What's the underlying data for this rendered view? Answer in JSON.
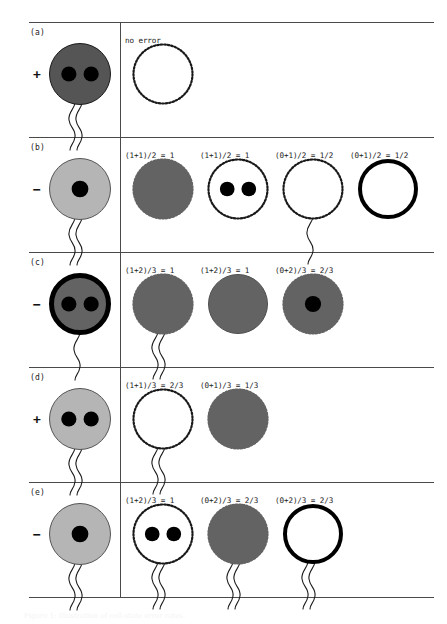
{
  "figure": {
    "label": "error-diagram",
    "caption": "Figure 1: Illustration of cell-state error rates.",
    "no_error_label": "no error",
    "divider_x": 120,
    "colors": {
      "rule": "#4a4a4a",
      "text": "#1a1a1a",
      "dark_gray": "#555555",
      "mid_gray": "#636363",
      "light_gray": "#b5b5b5",
      "black": "#000000",
      "white": "#ffffff"
    }
  },
  "rows": [
    {
      "tag": "(a)",
      "sign": "+",
      "source": {
        "fill": "#555555",
        "stroke": "#1a1a1a",
        "stroke_width": 1,
        "dotted": false,
        "dots": 2,
        "flagella": 2
      },
      "outcomes": [
        {
          "equation": "no error",
          "fill": "#ffffff",
          "stroke": "#1a1a1a",
          "stroke_width": 1,
          "dotted": true,
          "dots": 0,
          "flagella": 0
        }
      ]
    },
    {
      "tag": "(b)",
      "sign": "−",
      "source": {
        "fill": "#b5b5b5",
        "stroke": "#555555",
        "stroke_width": 1,
        "dotted": false,
        "dots": 1,
        "flagella": 2
      },
      "outcomes": [
        {
          "equation": "(1+1)/2 = 1",
          "fill": "#636363",
          "stroke": "#636363",
          "stroke_width": 1,
          "dotted": true,
          "dots": 0,
          "flagella": 0
        },
        {
          "equation": "(1+1)/2 = 1",
          "fill": "#ffffff",
          "stroke": "#1a1a1a",
          "stroke_width": 1,
          "dotted": true,
          "dots": 2,
          "flagella": 0
        },
        {
          "equation": "(0+1)/2 = 1/2",
          "fill": "#ffffff",
          "stroke": "#1a1a1a",
          "stroke_width": 1,
          "dotted": true,
          "dots": 0,
          "flagella": 1
        },
        {
          "equation": "(0+1)/2 = 1/2",
          "fill": "#ffffff",
          "stroke": "#000000",
          "stroke_width": 4,
          "dotted": false,
          "dots": 0,
          "flagella": 0
        }
      ]
    },
    {
      "tag": "(c)",
      "sign": "−",
      "source": {
        "fill": "#636363",
        "stroke": "#000000",
        "stroke_width": 5,
        "dotted": false,
        "dots": 2,
        "flagella": 1
      },
      "outcomes": [
        {
          "equation": "(1+2)/3 = 1",
          "fill": "#636363",
          "stroke": "#636363",
          "stroke_width": 1,
          "dotted": true,
          "dots": 0,
          "flagella": 2
        },
        {
          "equation": "(1+2)/3 = 1",
          "fill": "#636363",
          "stroke": "#4f4f4f",
          "stroke_width": 1,
          "dotted": false,
          "dots": 0,
          "flagella": 0
        },
        {
          "equation": "(0+2)/3 = 2/3",
          "fill": "#636363",
          "stroke": "#636363",
          "stroke_width": 1,
          "dotted": true,
          "dots": 1,
          "flagella": 0
        }
      ]
    },
    {
      "tag": "(d)",
      "sign": "+",
      "source": {
        "fill": "#b5b5b5",
        "stroke": "#555555",
        "stroke_width": 1,
        "dotted": false,
        "dots": 2,
        "flagella": 2
      },
      "outcomes": [
        {
          "equation": "(1+1)/3 = 2/3",
          "fill": "#ffffff",
          "stroke": "#1a1a1a",
          "stroke_width": 1,
          "dotted": true,
          "dots": 0,
          "flagella": 2
        },
        {
          "equation": "(0+1)/3 = 1/3",
          "fill": "#636363",
          "stroke": "#636363",
          "stroke_width": 1,
          "dotted": true,
          "dots": 0,
          "flagella": 0
        }
      ]
    },
    {
      "tag": "(e)",
      "sign": "−",
      "source": {
        "fill": "#b5b5b5",
        "stroke": "#555555",
        "stroke_width": 1,
        "dotted": false,
        "dots": 1,
        "flagella": 2
      },
      "outcomes": [
        {
          "equation": "(1+2)/3 = 1",
          "fill": "#ffffff",
          "stroke": "#1a1a1a",
          "stroke_width": 1,
          "dotted": true,
          "dots": 2,
          "flagella": 2
        },
        {
          "equation": "(0+2)/3 = 2/3",
          "fill": "#636363",
          "stroke": "#636363",
          "stroke_width": 1,
          "dotted": true,
          "dots": 0,
          "flagella": 2
        },
        {
          "equation": "(0+2)/3 = 2/3",
          "fill": "#ffffff",
          "stroke": "#000000",
          "stroke_width": 4,
          "dotted": false,
          "dots": 0,
          "flagella": 2
        }
      ]
    }
  ],
  "layout": {
    "row_tops": [
      22,
      137,
      252,
      367,
      482
    ],
    "row_bottom": 597,
    "source_cx": 80,
    "outcome_xs": [
      163,
      238,
      313,
      388
    ],
    "outcome_xs_c": [
      163,
      238,
      313
    ],
    "equation_y": 14,
    "circle_cy": 52,
    "radius": 30,
    "source_radius": 31
  }
}
